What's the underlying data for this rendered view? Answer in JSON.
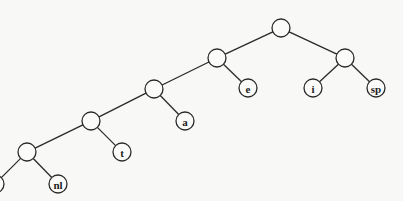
{
  "diagram": {
    "type": "binary-tree",
    "colors": {
      "background": "#f8f8f6",
      "stroke": "#2a2a2a",
      "node_fill": "#fbfbfa"
    },
    "node_radius": 9,
    "nodes": [
      {
        "id": "root",
        "x": 281,
        "y": 28,
        "label": ""
      },
      {
        "id": "n1",
        "x": 217,
        "y": 58,
        "label": ""
      },
      {
        "id": "n2",
        "x": 345,
        "y": 58,
        "label": ""
      },
      {
        "id": "leaf-e",
        "x": 248,
        "y": 88,
        "label": "e"
      },
      {
        "id": "leaf-i",
        "x": 313,
        "y": 88,
        "label": "i"
      },
      {
        "id": "leaf-sp",
        "x": 376,
        "y": 88,
        "label": "sp"
      },
      {
        "id": "n3",
        "x": 154,
        "y": 89,
        "label": ""
      },
      {
        "id": "leaf-a",
        "x": 185,
        "y": 121,
        "label": "a"
      },
      {
        "id": "n4",
        "x": 91,
        "y": 121,
        "label": ""
      },
      {
        "id": "leaf-t",
        "x": 122,
        "y": 152,
        "label": "t"
      },
      {
        "id": "n5",
        "x": 27,
        "y": 152,
        "label": ""
      },
      {
        "id": "leaf-nl",
        "x": 58,
        "y": 184,
        "label": "nl"
      },
      {
        "id": "leaf-cut",
        "x": -5,
        "y": 184,
        "label": ""
      }
    ],
    "edges": [
      [
        "root",
        "n1"
      ],
      [
        "root",
        "n2"
      ],
      [
        "n1",
        "n3"
      ],
      [
        "n1",
        "leaf-e"
      ],
      [
        "n2",
        "leaf-i"
      ],
      [
        "n2",
        "leaf-sp"
      ],
      [
        "n3",
        "n4"
      ],
      [
        "n3",
        "leaf-a"
      ],
      [
        "n4",
        "n5"
      ],
      [
        "n4",
        "leaf-t"
      ],
      [
        "n5",
        "leaf-cut"
      ],
      [
        "n5",
        "leaf-nl"
      ]
    ]
  }
}
